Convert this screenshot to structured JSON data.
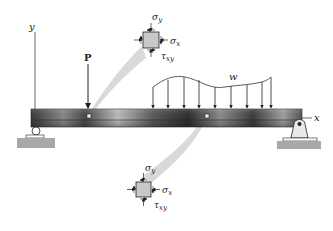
{
  "diagram": {
    "axes": {
      "x_label": "x",
      "y_label": "y"
    },
    "loads": {
      "point_load_label": "P",
      "distributed_load_label": "w"
    },
    "stress_element_top": {
      "sigma_y": "σ",
      "sigma_y_sub": "y",
      "sigma_x": "σ",
      "sigma_x_sub": "x",
      "tau_xy": "τ",
      "tau_xy_sub": "xy"
    },
    "stress_element_bottom": {
      "sigma_y": "σ",
      "sigma_y_sub": "y",
      "sigma_x": "σ",
      "sigma_x_sub": "x",
      "tau_xy": "τ",
      "tau_xy_sub": "xy"
    },
    "colors": {
      "beam_dark": "#3a3a3a",
      "beam_light": "#b5b5b5",
      "element_fill": "#c8c8c8",
      "cone_fill": "#d9d9d9",
      "ground_fill": "#a8a8a8",
      "line": "#222222"
    }
  }
}
